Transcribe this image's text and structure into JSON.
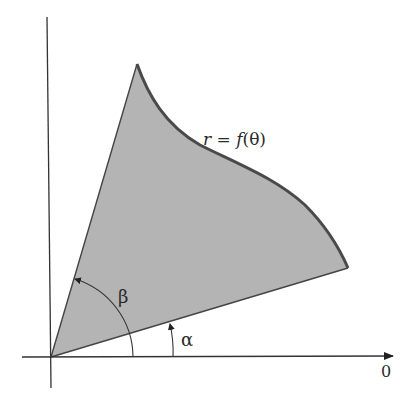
{
  "diagram": {
    "curve_label": "r = f(θ)",
    "curve_label_parts": {
      "r": "r",
      "eq": " = ",
      "f": "f",
      "arg": "(θ)"
    },
    "angle_alpha_label": "α",
    "angle_beta_label": "β",
    "axis_label_origin_ray": "0",
    "colors": {
      "region_fill": "#b4b4b4",
      "curve_stroke": "#4a4a4a",
      "axis_stroke": "#333333",
      "background": "#ffffff"
    }
  }
}
